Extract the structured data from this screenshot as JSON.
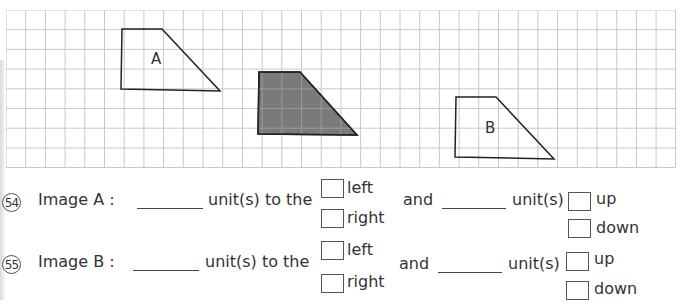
{
  "grid": {
    "cell_size_px": 19.7,
    "columns": 34,
    "rows": 8,
    "line_color": "#c8c8c8"
  },
  "figures": [
    {
      "label": "A",
      "fill": "none",
      "stroke": "#222222",
      "points": "116,19 156,19 214,81 115,79",
      "label_pos": [
        145,
        54
      ]
    },
    {
      "label": "",
      "fill": "#7a7a7a",
      "stroke": "#222222",
      "points": "253,62 294,62 351,125 252,124",
      "label_pos": null
    },
    {
      "label": "B",
      "fill": "none",
      "stroke": "#222222",
      "points": "450,87 490,87 548,149 449,147",
      "label_pos": [
        479,
        123
      ]
    }
  ],
  "questions": [
    {
      "number": "54",
      "image_label": "Image A :",
      "unit_text_1": "unit(s) to the",
      "horizontal_options": [
        "left",
        "right"
      ],
      "and_text": "and",
      "unit_text_2": "unit(s)",
      "vertical_options": [
        "up",
        "down"
      ]
    },
    {
      "number": "55",
      "image_label": "Image B :",
      "unit_text_1": "unit(s) to the",
      "horizontal_options": [
        "left",
        "right"
      ],
      "and_text": "and",
      "unit_text_2": "unit(s)",
      "vertical_options": [
        "up",
        "down"
      ]
    }
  ]
}
